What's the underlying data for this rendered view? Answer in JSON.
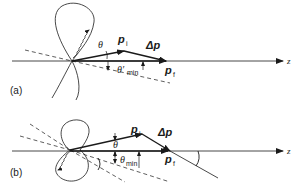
{
  "figure": {
    "panels": [
      {
        "id": "a",
        "label": "(a)",
        "vector_initial": "p",
        "vector_initial_sub": "i",
        "vector_final": "p",
        "vector_final_sub": "f",
        "delta": "Δp",
        "angle": "θ",
        "angle_min": "θ′",
        "angle_min_sub": "min",
        "axis": "z"
      },
      {
        "id": "b",
        "label": "(b)",
        "vector_initial": "p",
        "vector_initial_sub": "i",
        "vector_final": "p",
        "vector_final_sub": "f",
        "delta": "Δp",
        "angle": "θ",
        "angle_min": "θ",
        "angle_min_sub": "min",
        "axis": "z"
      }
    ],
    "colors": {
      "ink": "#1a1a1a",
      "background": "#ffffff"
    }
  }
}
